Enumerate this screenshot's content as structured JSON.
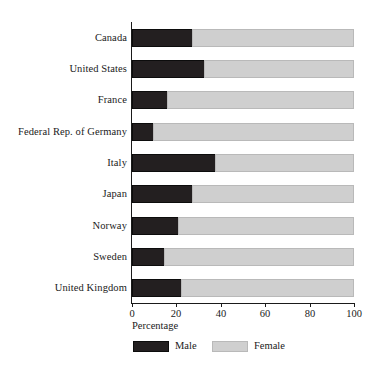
{
  "chart_data": {
    "type": "bar",
    "orientation": "horizontal",
    "stacked": true,
    "title": "",
    "subtitle": "",
    "xlabel": "Percentage",
    "ylabel": "",
    "xlim": [
      0,
      100
    ],
    "xticks": [
      0,
      20,
      40,
      60,
      80,
      100
    ],
    "xtick_labels": [
      "0",
      "20",
      "40",
      "60",
      "80",
      "100"
    ],
    "grid": false,
    "legend_position": "bottom",
    "categories": [
      "Canada",
      "United States",
      "France",
      "Federal Rep. of Germany",
      "Italy",
      "Japan",
      "Norway",
      "Sweden",
      "United Kingdom"
    ],
    "series": [
      {
        "name": "Male",
        "color": "#231f20",
        "values": [
          27.5,
          33.0,
          16.0,
          10.0,
          38.0,
          27.5,
          21.0,
          15.0,
          22.5
        ]
      },
      {
        "name": "Female",
        "color": "#cfcfcf",
        "values": [
          72.5,
          67.0,
          84.0,
          90.0,
          62.0,
          72.5,
          79.0,
          85.0,
          77.5
        ]
      }
    ]
  },
  "legend": {
    "items": [
      {
        "label": "Male",
        "swatch": "male"
      },
      {
        "label": "Female",
        "swatch": "female"
      }
    ]
  },
  "colors": {
    "male": "#231f20",
    "female": "#cfcfcf",
    "axis": "#1a1a1a",
    "background": "#ffffff"
  }
}
